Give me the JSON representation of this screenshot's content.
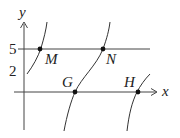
{
  "diagram": {
    "axes": {
      "x_label": "x",
      "y_label": "y"
    },
    "ticks": {
      "y5": "5",
      "y2": "2"
    },
    "points": {
      "M": "M",
      "N": "N",
      "G": "G",
      "H": "H"
    },
    "lines": [
      "y = 5 horizontal line"
    ],
    "curves": 3
  }
}
